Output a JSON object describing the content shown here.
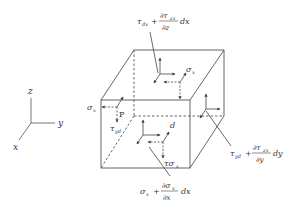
{
  "diagram": {
    "title": "",
    "type": "stress element cube",
    "colors": {
      "line": "#555555",
      "text": "#333333",
      "background": "#ffffff"
    },
    "axes": {
      "z_label": "z",
      "y_label": "y",
      "x_label": "x"
    },
    "point_label": "P",
    "point_d_label": "d",
    "labels": {
      "sigma_x_left": "σ",
      "sigma_x_left_sub": "x",
      "tau_yd_left": "τ",
      "tau_yd_left_sub": "yd",
      "sigma_x_top": "σ",
      "sigma_x_top_sub": "x",
      "tau_sigma_front": "τσ",
      "tau_sigma_front_sub": "x",
      "top_formula_a": "τ",
      "top_formula_a_sub": "dx",
      "top_formula_plus": "+",
      "top_formula_num": "∂τ",
      "top_formula_num_sub": "zx",
      "top_formula_den": "∂z",
      "top_formula_tail": "dx",
      "right_formula_a": "τ",
      "right_formula_a_sub": "yd",
      "right_formula_plus": "+",
      "right_formula_num": "∂τ",
      "right_formula_num_sub": "zx",
      "right_formula_den": "∂y",
      "right_formula_tail": "dy",
      "bottom_formula_a": "σ",
      "bottom_formula_a_sub": "x",
      "bottom_formula_plus": "+",
      "bottom_formula_num": "∂σ",
      "bottom_formula_num_sub": "x",
      "bottom_formula_den": "∂x",
      "bottom_formula_tail": "dx"
    }
  }
}
